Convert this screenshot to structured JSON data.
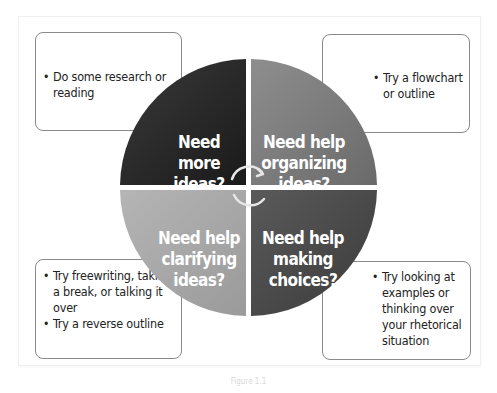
{
  "diagram": {
    "quadrants": [
      {
        "id": "top-left",
        "label": "Need more ideas?",
        "lines": [
          "Need",
          "more",
          "ideas?"
        ],
        "color": "#2b2b2b"
      },
      {
        "id": "top-right",
        "label": "Need help organizing ideas?",
        "lines": [
          "Need help",
          "organizing",
          "ideas?"
        ],
        "color": "#7a7a7a"
      },
      {
        "id": "bottom-left",
        "label": "Need help clarifying ideas?",
        "lines": [
          "Need help",
          "clarifying",
          "ideas?"
        ],
        "color": "#a9a9a9"
      },
      {
        "id": "bottom-right",
        "label": "Need help making choices?",
        "lines": [
          "Need help",
          "making",
          "choices?"
        ],
        "color": "#4a4a4a"
      }
    ],
    "boxes": {
      "top_left": [
        "Do some research or reading"
      ],
      "top_right": [
        "Try a flowchart or outline"
      ],
      "bottom_left": [
        "Try freewriting, taking a break, or talking it over",
        "Try a reverse outline"
      ],
      "bottom_right": [
        "Try looking at examples or thinking over your rhetorical situation"
      ]
    },
    "center_icon": "cycle-arrows-icon",
    "caption": "Figure 1.1"
  }
}
